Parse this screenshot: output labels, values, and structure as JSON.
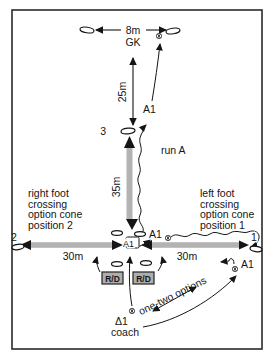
{
  "labels": {
    "m8": "8m",
    "gk": "GK",
    "m25": "25m",
    "cone3": "3",
    "a1_run": "A1",
    "run_a": "run A",
    "m35": "35m",
    "cone2": "2",
    "cone1": "1",
    "m30_left": "30m",
    "m30_right": "30m",
    "a1_center": "A1",
    "a1_option": "A1",
    "a1_right": "A1",
    "rd_left": "R/D",
    "rd_right": "R/D",
    "one_two": "one-two options",
    "delta1": "Δ1",
    "coach": "coach"
  },
  "notes": {
    "left": [
      "right foot",
      "crossing",
      "option cone",
      "position 2"
    ],
    "right": [
      "left foot",
      "crossing",
      "option cone",
      "position 1"
    ]
  },
  "colors": {
    "bar": "#b3b3b3",
    "box": "#aeaeae",
    "ink": "#151515",
    "frame": "#2a2a2a",
    "bg": "#ffffff"
  }
}
